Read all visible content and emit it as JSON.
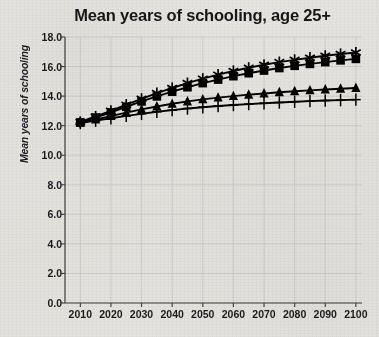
{
  "chart_data": {
    "type": "line",
    "title": "Mean years of schooling, age 25+",
    "xlabel": "",
    "ylabel": "Mean years of schooling",
    "xlim": [
      2005,
      2102
    ],
    "ylim": [
      0.0,
      18.0
    ],
    "grid": true,
    "legend_position": "none",
    "x": [
      2010,
      2015,
      2020,
      2025,
      2030,
      2035,
      2040,
      2045,
      2050,
      2055,
      2060,
      2065,
      2070,
      2075,
      2080,
      2085,
      2090,
      2095,
      2100
    ],
    "xticks": [
      "2010",
      "2020",
      "2030",
      "2040",
      "2050",
      "2060",
      "2070",
      "2080",
      "2090",
      "2100"
    ],
    "xtick_values": [
      2010,
      2020,
      2030,
      2040,
      2050,
      2060,
      2070,
      2080,
      2090,
      2100
    ],
    "yticks": [
      "0.0",
      "2.0",
      "4.0",
      "6.0",
      "8.0",
      "10.0",
      "12.0",
      "14.0",
      "16.0",
      "18.0"
    ],
    "ytick_values": [
      0.0,
      2.0,
      4.0,
      6.0,
      8.0,
      10.0,
      12.0,
      14.0,
      16.0,
      18.0
    ],
    "series": [
      {
        "name": "Series 1",
        "marker": "asterisk",
        "color": "#000000",
        "values": [
          12.25,
          12.62,
          13.0,
          13.42,
          13.82,
          14.2,
          14.55,
          14.88,
          15.18,
          15.45,
          15.7,
          15.92,
          16.12,
          16.3,
          16.45,
          16.6,
          16.73,
          16.85,
          16.95
        ]
      },
      {
        "name": "Series 2",
        "marker": "square",
        "color": "#000000",
        "values": [
          12.22,
          12.55,
          12.9,
          13.28,
          13.64,
          13.98,
          14.3,
          14.6,
          14.88,
          15.12,
          15.35,
          15.55,
          15.73,
          15.9,
          16.05,
          16.18,
          16.3,
          16.42,
          16.52
        ]
      },
      {
        "name": "Series 3",
        "marker": "triangle",
        "color": "#000000",
        "values": [
          12.2,
          12.42,
          12.65,
          12.88,
          13.1,
          13.3,
          13.48,
          13.64,
          13.78,
          13.9,
          14.0,
          14.1,
          14.18,
          14.26,
          14.33,
          14.39,
          14.45,
          14.5,
          14.55
        ]
      },
      {
        "name": "Series 4",
        "marker": "plus",
        "color": "#000000",
        "values": [
          12.18,
          12.34,
          12.5,
          12.66,
          12.8,
          12.94,
          13.05,
          13.16,
          13.25,
          13.33,
          13.4,
          13.46,
          13.52,
          13.57,
          13.62,
          13.66,
          13.7,
          13.73,
          13.76
        ]
      }
    ]
  },
  "colors": {
    "ink": "#000000",
    "axis": "#3c3c3e",
    "grid": "#d8d8d6",
    "paper": "#f2f1ef"
  }
}
